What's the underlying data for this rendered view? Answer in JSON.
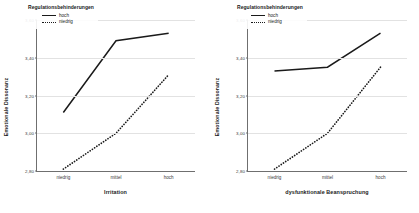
{
  "figure": {
    "background": "#ffffff",
    "line_color": "#1a1a1a",
    "grid_color": "#e2e2e2",
    "axis_color": "#6f6f6f"
  },
  "legend": {
    "title": "Regulationsbehinderungen",
    "entries": [
      {
        "label": "hoch",
        "style": "solid"
      },
      {
        "label": "niedrig",
        "style": "dotted"
      }
    ]
  },
  "chart_data": [
    {
      "type": "line",
      "title": "",
      "xlabel": "Irritation",
      "ylabel": "Emotionale Dissonanz",
      "categories": [
        "niedrig",
        "mittel",
        "hoch"
      ],
      "ylim": [
        2.8,
        3.6
      ],
      "yticks": [
        2.8,
        3.0,
        3.2,
        3.4,
        3.6
      ],
      "ytick_labels": [
        "2,80",
        "3,00",
        "3,20",
        "3,40",
        "3,60"
      ],
      "grid": true,
      "legend_position": "top-left",
      "series": [
        {
          "name": "hoch",
          "style": "solid",
          "values": [
            3.11,
            3.49,
            3.53
          ]
        },
        {
          "name": "niedrig",
          "style": "dotted",
          "values": [
            2.81,
            3.0,
            3.31
          ]
        }
      ]
    },
    {
      "type": "line",
      "title": "",
      "xlabel": "dysfunktionale Beanspruchung",
      "ylabel": "Emotionale Dissonanz",
      "categories": [
        "niedrig",
        "mittel",
        "hoch"
      ],
      "ylim": [
        2.8,
        3.6
      ],
      "yticks": [
        2.8,
        3.0,
        3.2,
        3.4,
        3.6
      ],
      "ytick_labels": [
        "2,80",
        "3,00",
        "3,20",
        "3,40",
        "3,60"
      ],
      "grid": true,
      "legend_position": "top-left",
      "series": [
        {
          "name": "hoch",
          "style": "solid",
          "values": [
            3.33,
            3.35,
            3.53
          ]
        },
        {
          "name": "niedrig",
          "style": "dotted",
          "values": [
            2.81,
            3.0,
            3.35
          ]
        }
      ]
    }
  ]
}
